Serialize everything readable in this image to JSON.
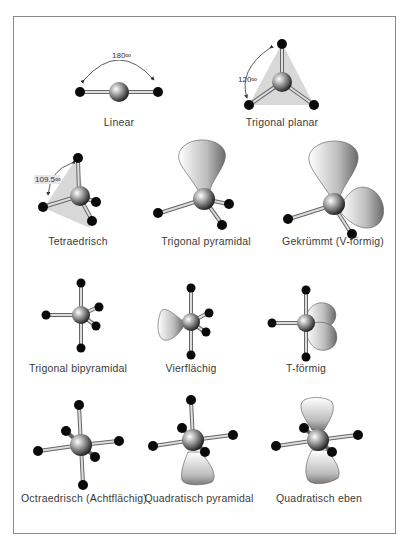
{
  "figure": {
    "molecules": [
      {
        "id": "linear",
        "label": "Linear",
        "angle": "180∞"
      },
      {
        "id": "trigonal-planar",
        "label": "Trigonal planar",
        "angle": "120∞"
      },
      {
        "id": "tetrahedral",
        "label": "Tetraedrisch",
        "angle": "109.5∞"
      },
      {
        "id": "trigonal-pyramidal",
        "label": "Trigonal pyramidal"
      },
      {
        "id": "bent",
        "label": "Gekrümmt (V-förmig)"
      },
      {
        "id": "trigonal-bipyramidal",
        "label": "Trigonal bipyramidal"
      },
      {
        "id": "seesaw",
        "label": "Vierflächig"
      },
      {
        "id": "t-shaped",
        "label": "T-förmig"
      },
      {
        "id": "octahedral",
        "label": "Octraedrisch (Achtflächig)"
      },
      {
        "id": "square-pyramidal",
        "label": "Quadratisch pyramidal"
      },
      {
        "id": "square-planar",
        "label": "Quadratisch eben"
      }
    ]
  },
  "colors": {
    "ligand": "#0a0a0a",
    "frame": "#8a8a8a",
    "plane": "#d8d8d8",
    "text": "#3a3a3a"
  }
}
